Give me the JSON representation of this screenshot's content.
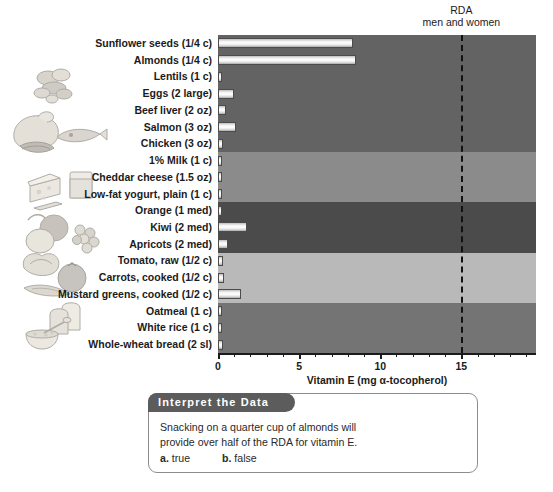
{
  "chart_data": {
    "type": "bar",
    "orientation": "horizontal",
    "title": "",
    "xlabel": "Vitamin E (mg α-tocopherol)",
    "ylabel": "",
    "xlim": [
      0,
      19.6
    ],
    "ticks": [
      0,
      5,
      10,
      15
    ],
    "ticklabels": [
      "0",
      "5",
      "10",
      "15"
    ],
    "minor_tick_step": 1,
    "grid": false,
    "legend": "none",
    "categories": [
      "Sunflower seeds (1/4 c)",
      "Almonds (1/4 c)",
      "Lentils (1 c)",
      "Eggs (2 large)",
      "Beef liver (2 oz)",
      "Salmon (3 oz)",
      "Chicken (3 oz)",
      "1% Milk (1 c)",
      "Cheddar cheese (1.5 oz)",
      "Low-fat yogurt, plain (1 c)",
      "Orange (1 med)",
      "Kiwi (2 med)",
      "Apricots (2 med)",
      "Tomato, raw (1/2 c)",
      "Carrots, cooked (1/2 c)",
      "Mustard greens, cooked (1/2 c)",
      "Oatmeal (1 c)",
      "White rice (1 c)",
      "Whole-wheat bread (2 sl)"
    ],
    "values": [
      8.3,
      8.5,
      0.2,
      1.0,
      0.5,
      1.1,
      0.3,
      0.1,
      0.1,
      0.1,
      0.2,
      1.8,
      0.6,
      0.3,
      0.4,
      1.4,
      0.2,
      0.05,
      0.3
    ],
    "annotations": [
      {
        "name": "rda-line",
        "type": "vline",
        "value": 15,
        "label_line1": "RDA",
        "label_line2": "men and women",
        "style": "dashed"
      }
    ],
    "groups": [
      {
        "name": "protein-foods",
        "start": 0,
        "end": 6,
        "shade": "#636363"
      },
      {
        "name": "dairy-foods",
        "start": 7,
        "end": 9,
        "shade": "#8b8b8b"
      },
      {
        "name": "fruits",
        "start": 10,
        "end": 12,
        "shade": "#4b4b4b"
      },
      {
        "name": "vegetables",
        "start": 13,
        "end": 15,
        "shade": "#b9b9b9"
      },
      {
        "name": "grains",
        "start": 16,
        "end": 18,
        "shade": "#747474"
      }
    ]
  },
  "axis": {
    "x_title": "Vitamin E (mg α-tocopherol)",
    "tick_0": "0",
    "tick_5": "5",
    "tick_10": "10",
    "tick_15": "15"
  },
  "rda": {
    "line1": "RDA",
    "line2": "men and women",
    "value": 15
  },
  "interpret": {
    "header": "Interpret the Data",
    "question_line1": "Snacking on a quarter cup of almonds will",
    "question_line2": "provide over half of the RDA for vitamin E.",
    "option_a_marker": "a.",
    "option_a_label": "true",
    "option_b_marker": "b.",
    "option_b_label": "false"
  },
  "illustrations": [
    {
      "name": "legumes-illustration",
      "alt": "lentils and beans"
    },
    {
      "name": "protein-foods-illustration",
      "alt": "chicken, fish and beef"
    },
    {
      "name": "dairy-illustration",
      "alt": "cheese wedge and glass of milk"
    },
    {
      "name": "fruits-illustration",
      "alt": "orange, kiwi and grapes"
    },
    {
      "name": "vegetables-illustration",
      "alt": "tomato, carrot and greens"
    },
    {
      "name": "grains-illustration",
      "alt": "bread slices and bowl of oatmeal"
    }
  ],
  "colors": {
    "bar_outline": "#4c4c4c",
    "bar_fill": "#ffffff",
    "rda_line": "#111111",
    "text": "#1b1b1b",
    "interpret_header_bg": "#5c5c5c"
  }
}
